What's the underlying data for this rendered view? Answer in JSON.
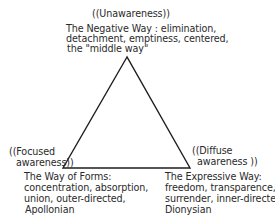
{
  "diagram": {
    "type": "triangle",
    "vertices": {
      "top": {
        "awareness_label": "((Unawareness))",
        "way_lines": [
          "The Negative Way : elimination,",
          "detachment, emptiness, centered,",
          "the \"middle way\""
        ]
      },
      "bottom_left": {
        "awareness_label_lines": [
          "((Focused",
          "awareness))"
        ],
        "way_lines": [
          "The Way of Forms:",
          "concentration, absorption,",
          "union, outer-directed,",
          "Apollonian"
        ]
      },
      "bottom_right": {
        "awareness_label_lines": [
          "((Diffuse",
          "awareness ))"
        ],
        "way_lines": [
          "The Expressive Way:",
          "freedom, transparence,",
          "surrender, inner-directed,",
          "Dionysian"
        ]
      }
    },
    "line_color": "#1e1e1e",
    "text_color": "#2a2a2a"
  }
}
